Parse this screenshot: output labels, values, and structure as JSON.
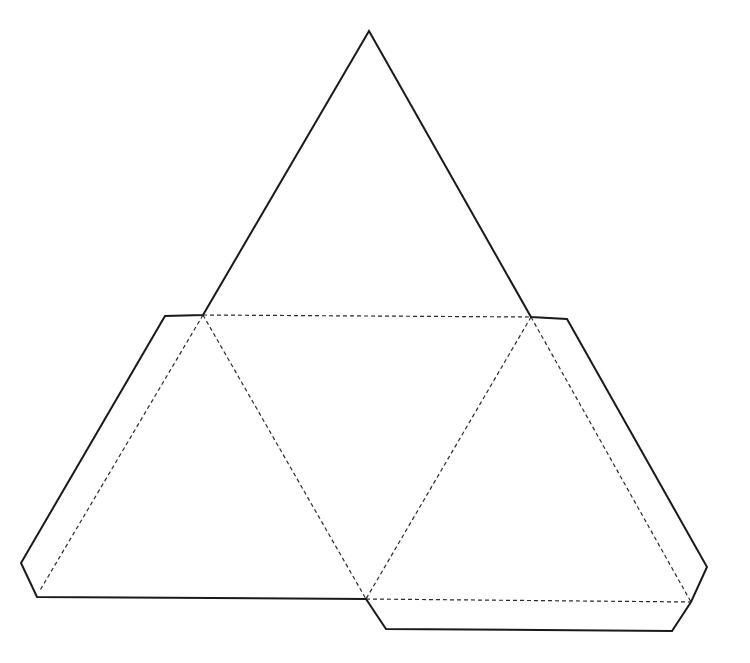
{
  "diagram": {
    "title": "",
    "background": "#ffffff",
    "colors": {
      "cut_line": "#1a1a1a",
      "fold_line": "#2a2a2a"
    },
    "faces": [
      {
        "name": "top-face",
        "points": [
          [
            369,
            31
          ],
          [
            203,
            315
          ],
          [
            531,
            317
          ]
        ]
      },
      {
        "name": "left-face",
        "points": [
          [
            203,
            315
          ],
          [
            39,
            592
          ],
          [
            366,
            599
          ]
        ]
      },
      {
        "name": "center-face",
        "points": [
          [
            203,
            315
          ],
          [
            531,
            317
          ],
          [
            366,
            599
          ]
        ]
      },
      {
        "name": "right-face",
        "points": [
          [
            531,
            317
          ],
          [
            366,
            599
          ],
          [
            691,
            602
          ]
        ]
      }
    ],
    "tabs": [
      {
        "name": "left-tab",
        "points": [
          [
            203,
            315
          ],
          [
            165,
            316
          ],
          [
            21,
            563
          ],
          [
            37,
            597
          ],
          [
            39,
            592
          ]
        ]
      },
      {
        "name": "right-tab",
        "points": [
          [
            531,
            317
          ],
          [
            567,
            319
          ],
          [
            707,
            567
          ],
          [
            691,
            602
          ]
        ]
      },
      {
        "name": "bottom-tab",
        "points": [
          [
            366,
            599
          ],
          [
            386,
            629
          ],
          [
            672,
            631
          ],
          [
            691,
            602
          ]
        ]
      }
    ],
    "outline": [
      [
        369,
        31
      ],
      [
        531,
        317
      ],
      [
        567,
        319
      ],
      [
        707,
        567
      ],
      [
        691,
        602
      ],
      [
        672,
        631
      ],
      [
        386,
        629
      ],
      [
        366,
        599
      ],
      [
        37,
        597
      ],
      [
        21,
        563
      ],
      [
        165,
        316
      ],
      [
        203,
        315
      ]
    ],
    "fold_lines": [
      [
        [
          203,
          315
        ],
        [
          531,
          317
        ]
      ],
      [
        [
          203,
          315
        ],
        [
          366,
          599
        ]
      ],
      [
        [
          531,
          317
        ],
        [
          366,
          599
        ]
      ],
      [
        [
          203,
          315
        ],
        [
          39,
          592
        ]
      ],
      [
        [
          531,
          317
        ],
        [
          691,
          602
        ]
      ],
      [
        [
          366,
          599
        ],
        [
          691,
          602
        ]
      ]
    ]
  }
}
